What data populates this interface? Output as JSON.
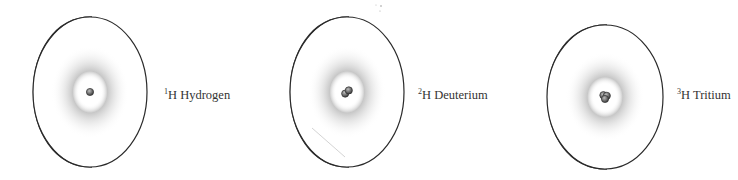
{
  "figure": {
    "isotopes": [
      {
        "mass_number": "1",
        "symbol": "H",
        "name": "Hydrogen",
        "nucleons": 1,
        "cx": 90,
        "cy": 92,
        "rx": 57,
        "ry": 75,
        "back_offset": 22,
        "label_x": 164,
        "label_y": 89
      },
      {
        "mass_number": "2",
        "symbol": "H",
        "name": "Deuterium",
        "nucleons": 2,
        "cx": 347,
        "cy": 92,
        "rx": 57,
        "ry": 75,
        "back_offset": 22,
        "label_x": 418,
        "label_y": 89
      },
      {
        "mass_number": "3",
        "symbol": "H",
        "name": "Tritium",
        "nucleons": 3,
        "cx": 605,
        "cy": 97,
        "rx": 58,
        "ry": 72,
        "back_offset": 22,
        "label_x": 677,
        "label_y": 89
      }
    ],
    "colors": {
      "outline": "#2a2a2a",
      "side_fill": "#e6e6e6",
      "cloud": "#9a9a9a",
      "nucleus": "#6a6a6a"
    }
  }
}
